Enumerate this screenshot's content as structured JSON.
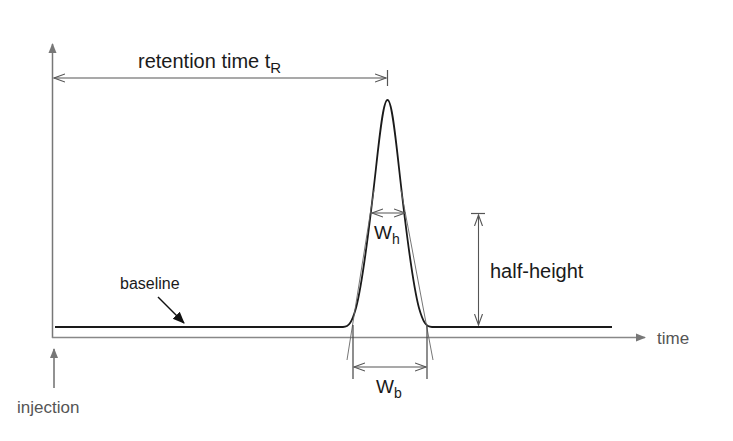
{
  "diagram": {
    "labels": {
      "retention_time": "retention time t",
      "retention_time_sub": "R",
      "width_half": "W",
      "width_half_sub": "h",
      "width_base": "W",
      "width_base_sub": "b",
      "half_height": "half-height",
      "baseline": "baseline",
      "time_axis": "time",
      "injection": "injection"
    },
    "colors": {
      "curve": "#1a1a1a",
      "axis": "#777777",
      "annotation": "#555555"
    }
  }
}
